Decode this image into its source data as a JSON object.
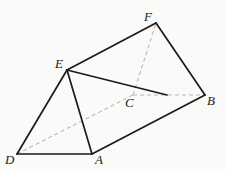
{
  "diagram": {
    "type": "geometric-solid",
    "colors": {
      "background": "#fafaf8",
      "solid_edge": "#1a1a1a",
      "hidden_edge": "#b8b8b8",
      "label": "#222222"
    },
    "vertices": {
      "A": {
        "x": 92,
        "y": 154
      },
      "B": {
        "x": 205,
        "y": 95
      },
      "C": {
        "x": 133,
        "y": 95
      },
      "D": {
        "x": 17,
        "y": 154
      },
      "E": {
        "x": 67,
        "y": 70
      },
      "F": {
        "x": 156,
        "y": 23
      }
    },
    "labels": [
      {
        "id": "A",
        "text": "A",
        "x": 95,
        "y": 164
      },
      {
        "id": "B",
        "text": "B",
        "x": 207,
        "y": 105
      },
      {
        "id": "C",
        "text": "C",
        "x": 125,
        "y": 107
      },
      {
        "id": "D",
        "text": "D",
        "x": 5,
        "y": 164
      },
      {
        "id": "E",
        "text": "E",
        "x": 55,
        "y": 68
      },
      {
        "id": "F",
        "text": "F",
        "x": 144,
        "y": 21
      }
    ],
    "solid_edges": [
      {
        "from": "D",
        "to": "A"
      },
      {
        "from": "D",
        "to": "E"
      },
      {
        "from": "E",
        "to": "A"
      },
      {
        "from": "A",
        "to": "B"
      },
      {
        "from": "B",
        "to": "F"
      },
      {
        "from": "F",
        "to": "E"
      },
      {
        "from": "E",
        "to": "P",
        "note": "E to point on CB",
        "x2": 167,
        "y2": 95
      }
    ],
    "dashed_edges": [
      {
        "from": "D",
        "to": "C"
      },
      {
        "from": "C",
        "to": "B"
      },
      {
        "from": "C",
        "to": "F"
      }
    ]
  }
}
